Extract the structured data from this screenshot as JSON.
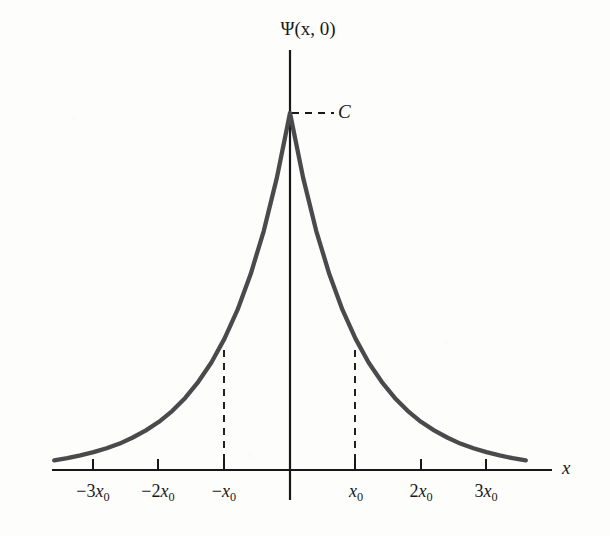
{
  "figure": {
    "background_color": "#fdfdfc",
    "ink_color": "#18181a",
    "curve_color": "#4a4a4c",
    "y_axis_label": "Ψ(x, 0)",
    "x_axis_label": "x",
    "amplitude_label": "C"
  },
  "axes": {
    "x_axis_pixel_y": 470,
    "y_axis_pixel_x": 290,
    "x_axis_left_px": 52,
    "x_axis_right_px": 552,
    "y_axis_top_px": 50,
    "y_axis_bottom_px": 500,
    "pixels_per_x0": 65.5
  },
  "ticks": [
    {
      "label_prefix": "−3",
      "label_var": "x",
      "label_sub": "0",
      "value": -3,
      "px": 93
    },
    {
      "label_prefix": "−2",
      "label_var": "x",
      "label_sub": "0",
      "value": -2,
      "px": 158
    },
    {
      "label_prefix": "−",
      "label_var": "x",
      "label_sub": "0",
      "value": -1,
      "px": 224
    },
    {
      "label_prefix": "",
      "label_var": "x",
      "label_sub": "0",
      "value": 1,
      "px": 355
    },
    {
      "label_prefix": "2",
      "label_var": "x",
      "label_sub": "0",
      "value": 2,
      "px": 421
    },
    {
      "label_prefix": "3",
      "label_var": "x",
      "label_sub": "0",
      "value": 3,
      "px": 486
    }
  ],
  "guides": {
    "amplitude_dashed_line": {
      "from_px": [
        292,
        113
      ],
      "to_px": [
        334,
        113
      ]
    },
    "vertical_dashed_lines": [
      {
        "at_value": -1,
        "x_px": 224,
        "top_px": 350,
        "bottom_px": 470
      },
      {
        "at_value": 1,
        "x_px": 355,
        "top_px": 350,
        "bottom_px": 470
      }
    ]
  },
  "chart_data": {
    "type": "line",
    "title": "",
    "subtitle": "",
    "xlabel": "x",
    "ylabel": "Ψ(x, 0)",
    "function": "Ψ(x,0) = C e^(-|x|/x₀)",
    "peak_value_label": "C",
    "peak_at_x": 0,
    "decay_length_label": "x₀",
    "grid": false,
    "legend": null,
    "xlim": [
      -3.6,
      3.6
    ],
    "ylim": [
      0,
      1.0
    ],
    "x_tick_values": [
      -3,
      -2,
      -1,
      1,
      2,
      3
    ],
    "x_tick_labels": [
      "−3x₀",
      "−2x₀",
      "−x₀",
      "x₀",
      "2x₀",
      "3x₀"
    ],
    "y_tick_values": [
      1.0
    ],
    "y_tick_labels": [
      "C"
    ],
    "series": [
      {
        "name": "Ψ(x, 0)",
        "x": [
          -3.6,
          -3.4,
          -3.2,
          -3.0,
          -2.8,
          -2.6,
          -2.4,
          -2.2,
          -2.0,
          -1.8,
          -1.6,
          -1.4,
          -1.2,
          -1.0,
          -0.8,
          -0.6,
          -0.4,
          -0.2,
          0.0,
          0.2,
          0.4,
          0.6,
          0.8,
          1.0,
          1.2,
          1.4,
          1.6,
          1.8,
          2.0,
          2.2,
          2.4,
          2.6,
          2.8,
          3.0,
          3.2,
          3.4,
          3.6
        ],
        "y": [
          0.027,
          0.033,
          0.041,
          0.05,
          0.061,
          0.074,
          0.091,
          0.111,
          0.135,
          0.165,
          0.202,
          0.247,
          0.301,
          0.368,
          0.449,
          0.549,
          0.67,
          0.819,
          1.0,
          0.819,
          0.67,
          0.549,
          0.449,
          0.368,
          0.301,
          0.247,
          0.202,
          0.165,
          0.135,
          0.111,
          0.091,
          0.074,
          0.061,
          0.05,
          0.041,
          0.033,
          0.027
        ]
      }
    ]
  }
}
